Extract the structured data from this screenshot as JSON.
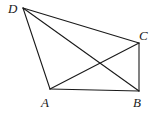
{
  "diagram": {
    "type": "geometry-quadrilateral",
    "points": {
      "A": {
        "x": 50,
        "y": 89,
        "label": "A",
        "lx": 41,
        "ly": 107
      },
      "B": {
        "x": 139,
        "y": 91,
        "label": "B",
        "lx": 133,
        "ly": 107
      },
      "C": {
        "x": 139,
        "y": 43,
        "label": "C",
        "lx": 139,
        "ly": 40
      },
      "D": {
        "x": 23,
        "y": 8,
        "label": "D",
        "lx": 8,
        "ly": 13
      }
    },
    "segments": [
      {
        "from": "D",
        "to": "A"
      },
      {
        "from": "D",
        "to": "C"
      },
      {
        "from": "D",
        "to": "B"
      },
      {
        "from": "A",
        "to": "B"
      },
      {
        "from": "A",
        "to": "C"
      },
      {
        "from": "C",
        "to": "B"
      }
    ],
    "stroke_color": "#1a1a1a"
  }
}
